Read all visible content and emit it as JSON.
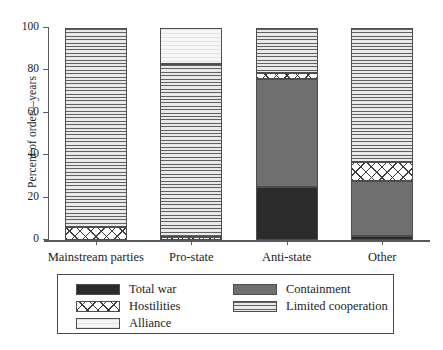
{
  "chart_data": {
    "type": "bar",
    "subtype": "stacked-bar-100",
    "title": "",
    "xlabel": "",
    "ylabel": "Percent of order—years",
    "ylim": [
      0,
      100
    ],
    "yticks": [
      0,
      20,
      40,
      60,
      80,
      100
    ],
    "ytick_labels": [
      "0",
      "20",
      "40",
      "60",
      "80",
      "100"
    ],
    "grid": false,
    "legend_position": "bottom",
    "categories": [
      "Mainstream parties",
      "Pro-state",
      "Anti-state",
      "Other"
    ],
    "series": [
      {
        "name": "Total war",
        "values": [
          0,
          0,
          25,
          2
        ]
      },
      {
        "name": "Containment",
        "values": [
          0,
          0,
          51,
          26
        ]
      },
      {
        "name": "Hostilities",
        "values": [
          6,
          1.5,
          3,
          9
        ]
      },
      {
        "name": "Limited cooperation",
        "values": [
          94,
          81.5,
          21,
          63
        ]
      },
      {
        "name": "Alliance",
        "values": [
          0,
          17,
          0,
          0
        ]
      }
    ],
    "stack_order": [
      "total_war",
      "containment",
      "hostilities",
      "limited_cooperation",
      "alliance"
    ],
    "stacks": [
      {
        "category": "Mainstream parties",
        "segments": [
          {
            "key": "hostilities",
            "label": "Hostilities",
            "start": 0,
            "end": 6
          },
          {
            "key": "limited_cooperation",
            "label": "Limited cooperation",
            "start": 6,
            "end": 100
          }
        ]
      },
      {
        "category": "Pro-state",
        "segments": [
          {
            "key": "hostilities",
            "label": "Hostilities",
            "start": 0,
            "end": 1.5
          },
          {
            "key": "limited_cooperation",
            "label": "Limited cooperation",
            "start": 1.5,
            "end": 83
          },
          {
            "key": "alliance",
            "label": "Alliance",
            "start": 83,
            "end": 100
          }
        ]
      },
      {
        "category": "Anti-state",
        "segments": [
          {
            "key": "total_war",
            "label": "Total war",
            "start": 0,
            "end": 25
          },
          {
            "key": "containment",
            "label": "Containment",
            "start": 25,
            "end": 76
          },
          {
            "key": "hostilities",
            "label": "Hostilities",
            "start": 76,
            "end": 79
          },
          {
            "key": "limited_cooperation",
            "label": "Limited cooperation",
            "start": 79,
            "end": 100
          }
        ]
      },
      {
        "category": "Other",
        "segments": [
          {
            "key": "total_war",
            "label": "Total war",
            "start": 0,
            "end": 2
          },
          {
            "key": "containment",
            "label": "Containment",
            "start": 2,
            "end": 28
          },
          {
            "key": "hostilities",
            "label": "Hostilities",
            "start": 28,
            "end": 37
          },
          {
            "key": "limited_cooperation",
            "label": "Limited cooperation",
            "start": 37,
            "end": 100
          }
        ]
      }
    ],
    "legend": [
      {
        "key": "total_war",
        "label": "Total war",
        "color": "#2b2b2b",
        "pattern": "solid-dark"
      },
      {
        "key": "hostilities",
        "label": "Hostilities",
        "color": "#ffffff",
        "pattern": "cross-hatch"
      },
      {
        "key": "alliance",
        "label": "Alliance",
        "color": "#efefef",
        "pattern": "very-light"
      },
      {
        "key": "containment",
        "label": "Containment",
        "color": "#6f6f6f",
        "pattern": "solid-gray"
      },
      {
        "key": "limited_cooperation",
        "label": "Limited cooperation",
        "color": "#d8d8d8",
        "pattern": "horizontal-lines"
      }
    ],
    "legend_columns": {
      "left": [
        "total_war",
        "hostilities",
        "alliance"
      ],
      "right": [
        "containment",
        "limited_cooperation"
      ]
    },
    "colors": {
      "total_war": "#2b2b2b",
      "containment": "#6f6f6f",
      "limited_cooperation": "#d8d8d8",
      "alliance": "#efefef",
      "hostilities": "#ffffff",
      "axis": "#5a5a5a",
      "text": "#1d1d1d"
    }
  }
}
